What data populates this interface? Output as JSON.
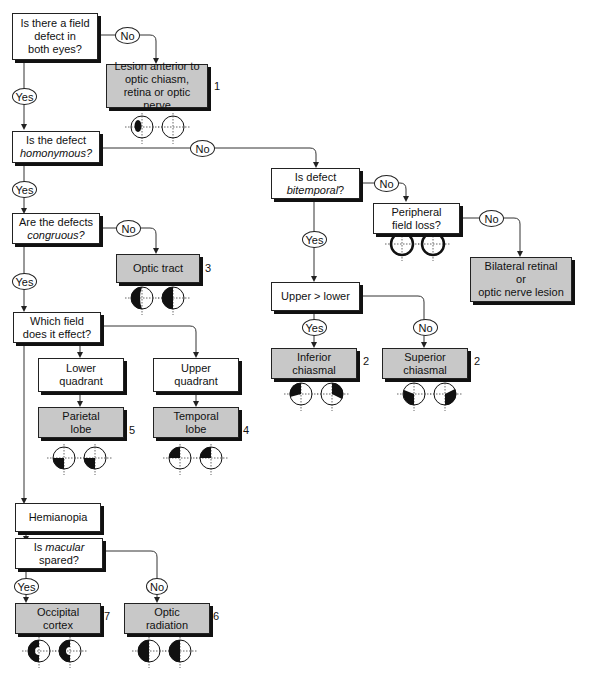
{
  "diagram": {
    "type": "flowchart",
    "questions": {
      "q1": {
        "line1": "Is there a field",
        "line2": "defect in",
        "line3": "both eyes?"
      },
      "q2": {
        "line1": "Is the defect",
        "line2": "homonymous?"
      },
      "q3": {
        "line1": "Are the defects",
        "line2": "congruous?"
      },
      "q4": {
        "line1": "Which field",
        "line2": "does it effect?"
      },
      "q5": {
        "line1": "Is defect",
        "line2": "bitemporal?",
        "suffix": "?"
      },
      "q6": {
        "line1": "Peripheral",
        "line2": "field loss?"
      },
      "q7": {
        "line1": "Upper > lower"
      },
      "q8": {
        "line1": "Is ",
        "italic": "macular",
        "line2": "spared?"
      }
    },
    "intermediate": {
      "lower_quadrant": {
        "line1": "Lower",
        "line2": "quadrant"
      },
      "upper_quadrant": {
        "line1": "Upper",
        "line2": "quadrant"
      },
      "hemianopia": {
        "line1": "Hemianopia"
      }
    },
    "results": {
      "r1": {
        "line1": "Lesion anterior to",
        "line2": "optic chiasm,",
        "line3": "retina or optic nerve",
        "number": "1"
      },
      "r2": {
        "line1": "Optic tract",
        "number": "3"
      },
      "r3": {
        "line1": "Bilateral retinal",
        "line2": "or",
        "line3": "optic nerve lesion"
      },
      "r4": {
        "line1": "Inferior",
        "line2": "chiasmal",
        "number": "2"
      },
      "r5": {
        "line1": "Superior",
        "line2": "chiasmal",
        "number": "2"
      },
      "r6": {
        "line1": "Parietal",
        "line2": "lobe",
        "number": "5"
      },
      "r7": {
        "line1": "Temporal",
        "line2": "lobe",
        "number": "4"
      },
      "r8": {
        "line1": "Occipital",
        "line2": "cortex",
        "number": "7"
      },
      "r9": {
        "line1": "Optic",
        "line2": "radiation",
        "number": "6"
      }
    },
    "edge_labels": {
      "yes": "Yes",
      "no": "No"
    },
    "field_icons": [
      {
        "for": "r1",
        "left": "central-scotoma-left",
        "right": "normal"
      },
      {
        "for": "r2",
        "left": "left-hemianopia-incongruous",
        "right": "left-hemianopia-incongruous"
      },
      {
        "for": "q6",
        "left": "peripheral-constriction",
        "right": "peripheral-constriction"
      },
      {
        "for": "r4",
        "left": "inferior-temporal-left",
        "right": "inferior-temporal-right"
      },
      {
        "for": "r5",
        "left": "superior-temporal-left",
        "right": "superior-temporal-right"
      },
      {
        "for": "r6",
        "left": "lower-left-quadrant",
        "right": "lower-left-quadrant"
      },
      {
        "for": "r7",
        "left": "upper-left-quadrant",
        "right": "upper-left-quadrant"
      },
      {
        "for": "r8",
        "left": "left-hemianopia-macular-sparing",
        "right": "left-hemianopia-macular-sparing"
      },
      {
        "for": "r9",
        "left": "left-hemianopia",
        "right": "left-hemianopia"
      }
    ],
    "colors": {
      "result_fill": "#c8c8c8",
      "box_fill": "#ffffff",
      "stroke": "#222222",
      "shadow": "#111111"
    }
  }
}
